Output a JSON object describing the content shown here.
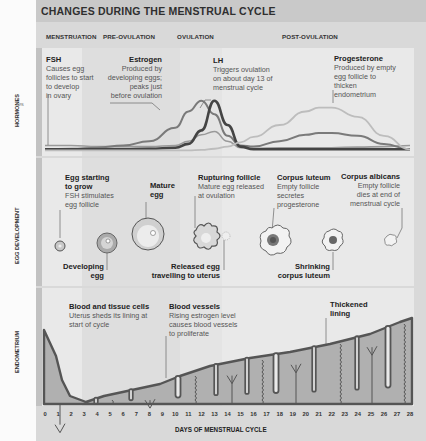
{
  "title": "CHANGES DURING THE MENSTRUAL CYCLE",
  "margin_fragment": "es",
  "phases": [
    "MENSTRUATION",
    "PRE-OVULATION",
    "OVULATION",
    "POST-OVULATION"
  ],
  "sections": {
    "hormones": "HORMONES",
    "egg_development": "EGG DEVELOPMENT",
    "endometrium": "ENDOMETRIUM"
  },
  "hormones": [
    {
      "name": "FSH",
      "lines": [
        "Causes egg",
        "follicles to start",
        "to develop",
        "in ovary"
      ]
    },
    {
      "name": "Estrogen",
      "lines": [
        "Produced by",
        "developing eggs;",
        "peaks just",
        "before ovulation"
      ]
    },
    {
      "name": "LH",
      "lines": [
        "Triggers ovulation",
        "on about day 13 of",
        "menstrual cycle"
      ]
    },
    {
      "name": "Progesterone",
      "lines": [
        "Produced by empty",
        "egg follicle to",
        "thicken",
        "endometrium"
      ]
    }
  ],
  "egg_stages_top": [
    {
      "name": "Egg starting to grow",
      "head_lines": [
        "Egg starting",
        "to grow"
      ],
      "lines": [
        "FSH stimulates",
        "egg follicle"
      ]
    },
    {
      "name": "Mature egg",
      "head_lines": [
        "Mature",
        "egg"
      ],
      "lines": []
    },
    {
      "name": "Rupturing follicle",
      "head_lines": [
        "Rupturing follicle"
      ],
      "lines": [
        "Mature egg released",
        "at ovulation"
      ]
    },
    {
      "name": "Corpus luteum",
      "head_lines": [
        "Corpus luteum"
      ],
      "lines": [
        "Empty follicle",
        "secretes",
        "progesterone"
      ]
    },
    {
      "name": "Corpus albicans",
      "head_lines": [
        "Corpus albicans"
      ],
      "lines": [
        "Empty follicle",
        "dies at end of",
        "menstrual cycle"
      ]
    }
  ],
  "egg_stages_bottom": [
    {
      "name": "Developing egg",
      "head_lines": [
        "Developing",
        "egg"
      ]
    },
    {
      "name": "Released egg travelling to uterus",
      "head_lines": [
        "Released egg",
        "travelling to uterus"
      ]
    },
    {
      "name": "Shrinking corpus luteum",
      "head_lines": [
        "Shrinking",
        "corpus luteum"
      ]
    }
  ],
  "endometrium_notes": [
    {
      "name": "Blood and tissue cells",
      "lines": [
        "Uterus sheds its lining at",
        "start of cycle"
      ]
    },
    {
      "name": "Blood vessels",
      "lines": [
        "Rising estrogen level",
        "causes blood vessels",
        "to proliferate"
      ]
    },
    {
      "name": "Thickened lining",
      "head_lines": [
        "Thickened",
        "lining"
      ],
      "lines": []
    }
  ],
  "x_axis": {
    "label": "DAYS OF MENSTRUAL CYCLE",
    "ticks": [
      "0",
      "1",
      "2",
      "3",
      "4",
      "5",
      "6",
      "7",
      "8",
      "9",
      "10",
      "11",
      "12",
      "13",
      "14",
      "15",
      "16",
      "17",
      "18",
      "19",
      "20",
      "21",
      "22",
      "23",
      "24",
      "25",
      "26",
      "27",
      "28"
    ]
  },
  "chart_data": {
    "type": "line",
    "xlabel": "DAYS OF MENSTRUAL CYCLE",
    "ylabel": "HORMONES",
    "xlim": [
      0,
      28
    ],
    "ylim": [
      0,
      1
    ],
    "x": [
      0,
      2,
      4,
      6,
      8,
      10,
      11,
      12,
      13,
      14,
      15,
      16,
      18,
      20,
      21,
      22,
      24,
      26,
      28
    ],
    "series": [
      {
        "name": "FSH",
        "values": [
          0.12,
          0.12,
          0.1,
          0.1,
          0.1,
          0.12,
          0.2,
          0.32,
          0.38,
          0.2,
          0.08,
          0.07,
          0.08,
          0.08,
          0.08,
          0.08,
          0.09,
          0.1,
          0.12
        ]
      },
      {
        "name": "Estrogen",
        "values": [
          0.05,
          0.06,
          0.08,
          0.12,
          0.2,
          0.45,
          0.75,
          0.95,
          0.7,
          0.3,
          0.12,
          0.1,
          0.2,
          0.32,
          0.35,
          0.35,
          0.3,
          0.15,
          0.05
        ]
      },
      {
        "name": "LH",
        "values": [
          0.05,
          0.05,
          0.05,
          0.05,
          0.06,
          0.08,
          0.15,
          0.4,
          0.95,
          0.5,
          0.1,
          0.05,
          0.05,
          0.05,
          0.05,
          0.05,
          0.05,
          0.05,
          0.05
        ]
      },
      {
        "name": "Progesterone",
        "values": [
          0.03,
          0.03,
          0.03,
          0.03,
          0.03,
          0.03,
          0.03,
          0.04,
          0.06,
          0.1,
          0.18,
          0.28,
          0.5,
          0.75,
          0.82,
          0.82,
          0.65,
          0.3,
          0.05
        ]
      }
    ]
  }
}
